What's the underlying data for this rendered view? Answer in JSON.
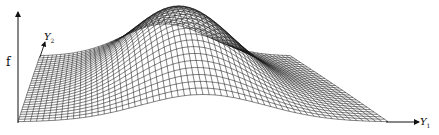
{
  "figure": {
    "type": "3d-wireframe-surface",
    "axes": {
      "vertical": {
        "label": "f"
      },
      "depth": {
        "label": "Y",
        "subscript": "2"
      },
      "horizontal": {
        "label": "Y",
        "subscript": "1"
      }
    },
    "grid": {
      "rows": 28,
      "cols": 60
    },
    "line_color": "#1a1a1a",
    "background": "#ffffff"
  }
}
